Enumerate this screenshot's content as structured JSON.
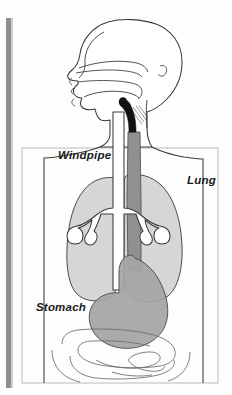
{
  "figure": {
    "type": "anatomical-line-diagram",
    "orientation": "head-in-profile-facing-left",
    "background_color": "#fdfdfd",
    "ink_color": "#2b2b2b"
  },
  "scan_artifacts": {
    "left_margin_bar": {
      "name": "page-edge-shadow",
      "color": "#8e8e8e",
      "x": 6,
      "y": 18,
      "width": 5,
      "height": 370
    }
  },
  "panel": {
    "name": "figure-border-box",
    "border_color": "#b4b4b4",
    "x": 22,
    "y": 148,
    "width": 196,
    "height": 235
  },
  "labels": [
    {
      "id": "windpipe",
      "text": "Windpipe",
      "x": 58,
      "y": 159,
      "style": "bold-italic"
    },
    {
      "id": "lung",
      "text": "Lung",
      "x": 187,
      "y": 184,
      "style": "bold-italic"
    },
    {
      "id": "stomach",
      "text": "Stomach",
      "x": 36,
      "y": 311,
      "style": "bold-italic"
    }
  ],
  "organs": {
    "head": {
      "name": "head-profile",
      "fill": "none",
      "stroke": "#3a3a3a"
    },
    "torso": {
      "name": "torso-outline",
      "fill": "none",
      "stroke": "#3a3a3a"
    },
    "lungs": {
      "name": "lungs",
      "fill": "#d6d6d6",
      "stroke": "#4a4a4a",
      "count": 2
    },
    "trachea": {
      "name": "windpipe-trachea-bronchi",
      "fill": "#ffffff",
      "stroke": "#3a3a3a"
    },
    "esophagus": {
      "name": "esophagus",
      "fill": "#909090",
      "stroke": "#4a4a4a",
      "upper_segment_fill": "#121212"
    },
    "stomach": {
      "name": "stomach",
      "fill": "#a5a5a5",
      "stroke": "#4a4a4a"
    },
    "intestines": {
      "name": "intestines",
      "fill": "#ffffff",
      "stroke": "#6a6a6a"
    }
  },
  "colors": {
    "lung_gray": "#d6d6d6",
    "stomach_gray": "#a5a5a5",
    "esophagus_gray": "#909090",
    "outline": "#3a3a3a",
    "margin_bar": "#8e8e8e",
    "panel_border": "#b4b4b4"
  }
}
